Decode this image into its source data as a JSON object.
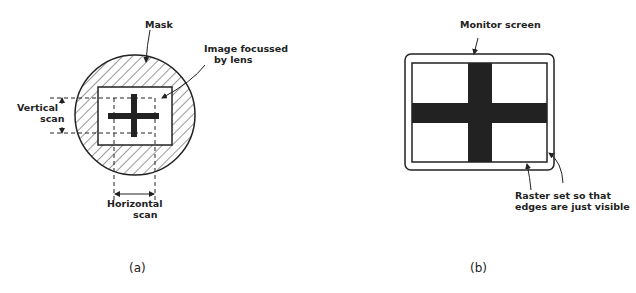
{
  "panel_a": {
    "caption": "(a)",
    "labels": {
      "mask": "Mask",
      "image_line1": "Image focussed",
      "image_line2": "by lens",
      "vertical_line1": "Vertical",
      "vertical_line2": "scan",
      "horizontal_line1": "Horizontal",
      "horizontal_line2": "scan"
    }
  },
  "panel_b": {
    "caption": "(b)",
    "labels": {
      "monitor": "Monitor screen",
      "raster_line1": "Raster set so that",
      "raster_line2": "edges are just visible"
    }
  }
}
